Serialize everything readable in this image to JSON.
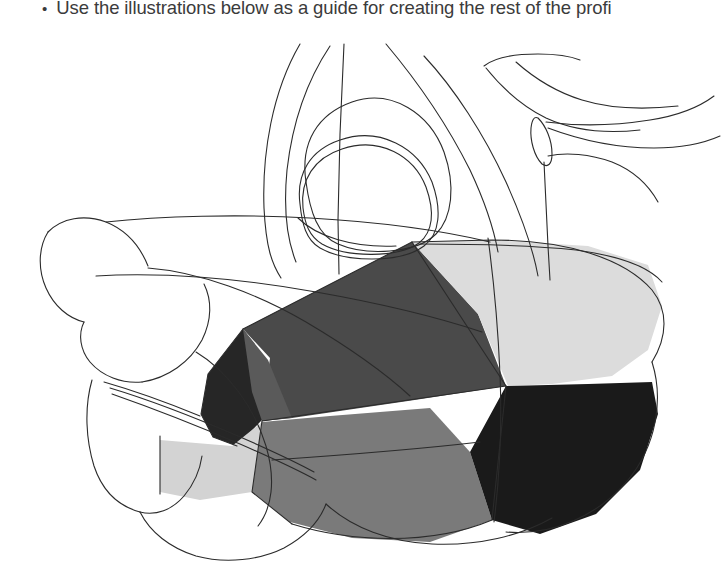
{
  "slide": {
    "background_color": "#ffffff",
    "bullet": {
      "marker": "•",
      "text": "Use the illustrations below as a guide for creating the rest of the profi",
      "text_color": "#3b3b3b",
      "clipped": "true"
    }
  },
  "illustration": {
    "name": "shaded-profile-line-drawing",
    "description": "Technical line drawing of a rounded profile form with faceted grayscale shading overlaid on contour outlines",
    "line_color": "#2b2b2b",
    "line_width": "1.1",
    "facets": [
      {
        "id": "facet-upper-left-dark",
        "label": "upper left mid-dark facet",
        "fill": "#5a5a5a"
      },
      {
        "id": "facet-nose-tip-black",
        "label": "left tip near-black facet",
        "fill": "#262626"
      },
      {
        "id": "facet-upper-right-light",
        "label": "upper right light facet",
        "fill": "#dcdcdc"
      },
      {
        "id": "facet-lower-mid-gray",
        "label": "lower middle mid-gray facet",
        "fill": "#7a7a7a"
      },
      {
        "id": "facet-lower-right-black",
        "label": "lower right near-black facet",
        "fill": "#1a1a1a"
      },
      {
        "id": "facet-left-pale",
        "label": "left pale gray facet",
        "fill": "#d3d3d3"
      },
      {
        "id": "facet-center-dark",
        "label": "central dark facet",
        "fill": "#4a4a4a"
      }
    ]
  }
}
